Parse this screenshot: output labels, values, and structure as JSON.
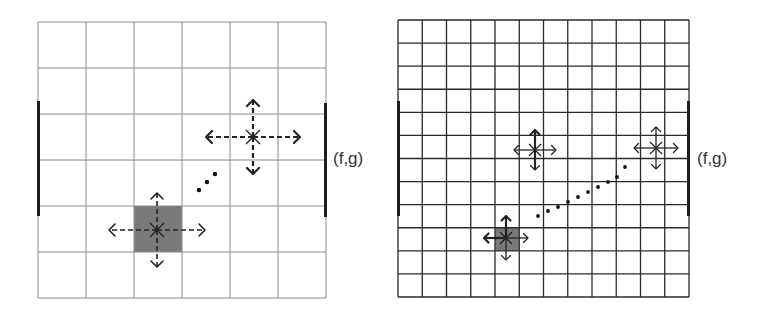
{
  "colors": {
    "grid_line_left": "#8a8a8a",
    "grid_line_right": "#2a2a2a",
    "edge_bar": "#1e1e1e",
    "shaded_cell": "#7a7a7a",
    "arrow": "#222222",
    "dot": "#111111",
    "label": "#333333"
  },
  "panels": [
    {
      "id": "coarse",
      "grid": {
        "x": 38,
        "y": 22,
        "width": 288,
        "height": 276,
        "cols": 6,
        "rows": 6,
        "line_width": 1
      },
      "edge_bars": [
        {
          "x": 38.5,
          "y1": 101,
          "y2": 216
        },
        {
          "x": 325.5,
          "y1": 103,
          "y2": 217
        }
      ],
      "shaded_cells": [
        {
          "col": 2,
          "row": 4
        }
      ],
      "markers": [
        {
          "x": 157,
          "y": 230,
          "h_len": 48,
          "v_len": 37,
          "star": 7,
          "dashed": true,
          "bold": false
        },
        {
          "x": 253,
          "y": 137,
          "h_len": 47,
          "v_len": 37,
          "star": 7,
          "dashed": true,
          "bold": true
        }
      ],
      "dots": [
        {
          "x": 199,
          "y": 190
        },
        {
          "x": 207,
          "y": 182
        },
        {
          "x": 215,
          "y": 174
        }
      ],
      "label": {
        "text": "(f,g)",
        "x": 333,
        "y": 149
      }
    },
    {
      "id": "fine",
      "grid": {
        "x": 398,
        "y": 20,
        "width": 291,
        "height": 277,
        "cols": 12,
        "rows": 12,
        "line_width": 1
      },
      "edge_bars": [
        {
          "x": 398.5,
          "y1": 101,
          "y2": 216
        },
        {
          "x": 688.5,
          "y1": 101,
          "y2": 216
        }
      ],
      "shaded_cells": [
        {
          "col": 4,
          "row": 9
        }
      ],
      "markers": [
        {
          "x": 506,
          "y": 238,
          "h_len": 22,
          "v_len": 22,
          "star": 6,
          "dashed": false,
          "bold": true,
          "right_thin": true
        },
        {
          "x": 535,
          "y": 150,
          "h_len": 21,
          "v_len": 20,
          "star": 6,
          "dashed": false,
          "bold": true,
          "mixed": true
        },
        {
          "x": 656,
          "y": 148,
          "h_len": 22,
          "v_len": 21,
          "star": 6,
          "dashed": false,
          "bold": false
        }
      ],
      "dots": [
        {
          "x": 538,
          "y": 216
        },
        {
          "x": 548,
          "y": 211
        },
        {
          "x": 558,
          "y": 207
        },
        {
          "x": 568,
          "y": 202
        },
        {
          "x": 578,
          "y": 197
        },
        {
          "x": 588,
          "y": 192
        },
        {
          "x": 598,
          "y": 187
        },
        {
          "x": 608,
          "y": 182
        },
        {
          "x": 617,
          "y": 177
        },
        {
          "x": 625,
          "y": 167
        }
      ],
      "label": {
        "text": "(f,g)",
        "x": 697,
        "y": 149
      }
    }
  ]
}
